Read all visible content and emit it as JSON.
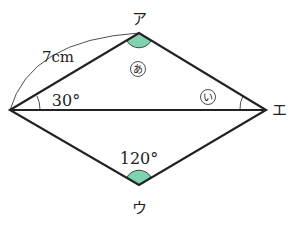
{
  "figure": {
    "vertices": {
      "top": "ア",
      "right": "エ",
      "bottom": "ウ"
    },
    "side_length": "7cm",
    "angles": {
      "left_angle": "30°",
      "bottom_angle": "120°",
      "angle_a": "あ",
      "angle_i": "い"
    },
    "colors": {
      "highlight": "#7fd3b0",
      "line": "#222222"
    }
  }
}
